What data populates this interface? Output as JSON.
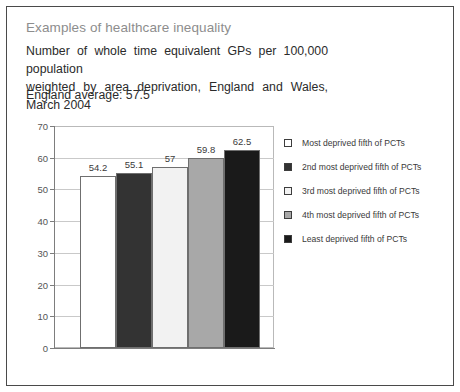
{
  "heading": "Examples of healthcare inequality",
  "subtitle_line1": "Number of whole time equivalent GPs per 100,000 population",
  "subtitle_line2": "weighted by area deprivation, England and Wales, March 2004",
  "england_average": "England average: 57.5",
  "chart_data": {
    "type": "bar",
    "title": "Number of whole time equivalent GPs per 100,000 population weighted by area deprivation, England and Wales, March 2004",
    "xlabel": "",
    "ylabel": "",
    "ylim": [
      0,
      70
    ],
    "ytick_step": 10,
    "yticks": [
      "70",
      "60",
      "50",
      "40",
      "30",
      "20",
      "10",
      "0"
    ],
    "grid": true,
    "legend_position": "right",
    "categories": [
      "Most deprived fifth of PCTs",
      "2nd most deprived fifth of PCTs",
      "3rd most deprived fifth of PCTs",
      "4th most deprived fifth of PCTs",
      "Least deprived fifth of PCTs"
    ],
    "values": [
      54.2,
      55.1,
      57,
      59.8,
      62.5
    ],
    "value_labels": [
      "54.2",
      "55.1",
      "57",
      "59.8",
      "62.5"
    ],
    "colors": [
      "#ffffff",
      "#333333",
      "#f2f2f2",
      "#a8a8a8",
      "#1a1a1a"
    ],
    "reference_value": 57.5
  },
  "legend": [
    {
      "label": "Most deprived fifth of PCTs",
      "color": "#ffffff"
    },
    {
      "label": "2nd most deprived fifth of PCTs",
      "color": "#333333"
    },
    {
      "label": "3rd most deprived fifth of PCTs",
      "color": "#f2f2f2"
    },
    {
      "label": "4th most deprived fifth of PCTs",
      "color": "#a8a8a8"
    },
    {
      "label": "Least deprived fifth of PCTs",
      "color": "#1a1a1a"
    }
  ]
}
